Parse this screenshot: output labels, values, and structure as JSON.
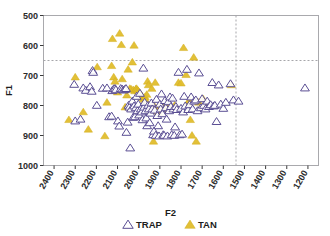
{
  "chart_data": {
    "type": "scatter",
    "title": "",
    "xlabel": "F2",
    "ylabel": "F1",
    "xlim": [
      2450,
      1150
    ],
    "ylim": [
      1000,
      500
    ],
    "x_inverted": true,
    "y_inverted": true,
    "grid": false,
    "legend_position": "bottom",
    "xticks": [
      2400,
      2300,
      2200,
      2100,
      2000,
      1900,
      1800,
      1700,
      1600,
      1500,
      1400,
      1300,
      1200
    ],
    "yticks": [
      500,
      600,
      700,
      800,
      900,
      1000
    ],
    "reference_lines": [
      {
        "orientation": "horizontal",
        "value": 650,
        "style": "dashed"
      },
      {
        "orientation": "vertical",
        "value": 1540,
        "style": "dashed"
      }
    ],
    "series": [
      {
        "name": "TRAP",
        "marker": "open-triangle",
        "color": "#ffffff",
        "edge_color": "#5b4f94",
        "points": [
          [
            2305,
            730
          ],
          [
            2300,
            852
          ],
          [
            2275,
            846
          ],
          [
            2262,
            742
          ],
          [
            2250,
            750
          ],
          [
            2230,
            738
          ],
          [
            2222,
            753
          ],
          [
            2218,
            684
          ],
          [
            2215,
            690
          ],
          [
            2198,
            800
          ],
          [
            2170,
            743
          ],
          [
            2150,
            742
          ],
          [
            2140,
            838
          ],
          [
            2128,
            836
          ],
          [
            2125,
            751
          ],
          [
            2118,
            745
          ],
          [
            2112,
            744
          ],
          [
            2108,
            748
          ],
          [
            2098,
            852
          ],
          [
            2092,
            869
          ],
          [
            2085,
            744
          ],
          [
            2078,
            746
          ],
          [
            2072,
            749
          ],
          [
            2066,
            747
          ],
          [
            2060,
            744
          ],
          [
            2058,
            890
          ],
          [
            2052,
            856
          ],
          [
            2048,
            800
          ],
          [
            2044,
            806
          ],
          [
            2040,
            942
          ],
          [
            2036,
            812
          ],
          [
            2030,
            786
          ],
          [
            2026,
            840
          ],
          [
            2022,
            802
          ],
          [
            2018,
            838
          ],
          [
            2014,
            808
          ],
          [
            2010,
            770
          ],
          [
            2006,
            818
          ],
          [
            2002,
            796
          ],
          [
            1998,
            832
          ],
          [
            1994,
            760
          ],
          [
            1990,
            812
          ],
          [
            1986,
            822
          ],
          [
            1982,
            848
          ],
          [
            1978,
            676
          ],
          [
            1975,
            806
          ],
          [
            1972,
            790
          ],
          [
            1968,
            818
          ],
          [
            1964,
            842
          ],
          [
            1960,
            868
          ],
          [
            1956,
            800
          ],
          [
            1952,
            812
          ],
          [
            1948,
            858
          ],
          [
            1944,
            826
          ],
          [
            1940,
            792
          ],
          [
            1936,
            812
          ],
          [
            1932,
            898
          ],
          [
            1928,
            886
          ],
          [
            1924,
            816
          ],
          [
            1920,
            900
          ],
          [
            1916,
            780
          ],
          [
            1912,
            834
          ],
          [
            1908,
            868
          ],
          [
            1904,
            902
          ],
          [
            1900,
            796
          ],
          [
            1896,
            812
          ],
          [
            1892,
            762
          ],
          [
            1888,
            828
          ],
          [
            1884,
            898
          ],
          [
            1880,
            900
          ],
          [
            1876,
            784
          ],
          [
            1872,
            808
          ],
          [
            1868,
            846
          ],
          [
            1864,
            902
          ],
          [
            1860,
            788
          ],
          [
            1856,
            818
          ],
          [
            1852,
            772
          ],
          [
            1848,
            804
          ],
          [
            1844,
            898
          ],
          [
            1840,
            776
          ],
          [
            1836,
            812
          ],
          [
            1832,
            900
          ],
          [
            1828,
            872
          ],
          [
            1824,
            804
          ],
          [
            1820,
            814
          ],
          [
            1812,
            690
          ],
          [
            1806,
            898
          ],
          [
            1800,
            810
          ],
          [
            1795,
            896
          ],
          [
            1790,
            822
          ],
          [
            1785,
            770
          ],
          [
            1780,
            802
          ],
          [
            1772,
            680
          ],
          [
            1766,
            814
          ],
          [
            1760,
            798
          ],
          [
            1752,
            772
          ],
          [
            1745,
            812
          ],
          [
            1738,
            786
          ],
          [
            1730,
            782
          ],
          [
            1722,
            818
          ],
          [
            1715,
            692
          ],
          [
            1706,
            808
          ],
          [
            1700,
            778
          ],
          [
            1692,
            800
          ],
          [
            1684,
            812
          ],
          [
            1676,
            786
          ],
          [
            1668,
            804
          ],
          [
            1660,
            798
          ],
          [
            1652,
            724
          ],
          [
            1646,
            802
          ],
          [
            1640,
            800
          ],
          [
            1632,
            854
          ],
          [
            1622,
            732
          ],
          [
            1612,
            796
          ],
          [
            1600,
            810
          ],
          [
            1588,
            790
          ],
          [
            1566,
            728
          ],
          [
            1552,
            782
          ],
          [
            1528,
            786
          ],
          [
            1214,
            742
          ]
        ]
      },
      {
        "name": "TAN",
        "marker": "filled-triangle",
        "color": "#e0bd2c",
        "points": [
          [
            2330,
            848
          ],
          [
            2300,
            706
          ],
          [
            2262,
            822
          ],
          [
            2238,
            880
          ],
          [
            2196,
            672
          ],
          [
            2160,
            902
          ],
          [
            2150,
            790
          ],
          [
            2128,
            668
          ],
          [
            2124,
            578
          ],
          [
            2118,
            706
          ],
          [
            2112,
            720
          ],
          [
            2108,
            750
          ],
          [
            2100,
            756
          ],
          [
            2090,
            560
          ],
          [
            2082,
            598
          ],
          [
            2078,
            712
          ],
          [
            2064,
            806
          ],
          [
            2056,
            766
          ],
          [
            2050,
            680
          ],
          [
            2042,
            744
          ],
          [
            2036,
            746
          ],
          [
            2030,
            656
          ],
          [
            2026,
            748
          ],
          [
            2022,
            600
          ],
          [
            2018,
            752
          ],
          [
            2014,
            746
          ],
          [
            2010,
            744
          ],
          [
            2006,
            748
          ],
          [
            2002,
            752
          ],
          [
            1998,
            756
          ],
          [
            1994,
            760
          ],
          [
            1990,
            764
          ],
          [
            1986,
            768
          ],
          [
            1982,
            772
          ],
          [
            1978,
            776
          ],
          [
            1974,
            780
          ],
          [
            1970,
            772
          ],
          [
            1966,
            784
          ],
          [
            1962,
            764
          ],
          [
            1958,
            720
          ],
          [
            1954,
            732
          ],
          [
            1950,
            806
          ],
          [
            1946,
            812
          ],
          [
            1942,
            818
          ],
          [
            1938,
            744
          ],
          [
            1934,
            804
          ],
          [
            1930,
            920
          ],
          [
            1926,
            802
          ],
          [
            1922,
            724
          ],
          [
            1918,
            898
          ],
          [
            1912,
            808
          ],
          [
            1906,
            824
          ],
          [
            1900,
            806
          ],
          [
            1894,
            810
          ],
          [
            1888,
            814
          ],
          [
            1882,
            806
          ],
          [
            1876,
            808
          ],
          [
            1868,
            802
          ],
          [
            1856,
            806
          ],
          [
            1844,
            810
          ],
          [
            1830,
            800
          ],
          [
            1812,
            724
          ],
          [
            1800,
            726
          ],
          [
            1788,
            608
          ],
          [
            1776,
            698
          ],
          [
            1768,
            792
          ],
          [
            1760,
            782
          ],
          [
            1756,
            848
          ],
          [
            1748,
            900
          ],
          [
            1740,
            640
          ],
          [
            1728,
            920
          ],
          [
            1716,
            790
          ],
          [
            1706,
            806
          ],
          [
            1696,
            778
          ],
          [
            1686,
            800
          ],
          [
            1562,
            732
          ]
        ]
      }
    ]
  },
  "axes": {
    "x_title": "F2",
    "y_title": "F1",
    "x_tick_labels": [
      "2400",
      "2300",
      "2200",
      "2100",
      "2000",
      "1900",
      "1800",
      "1700",
      "1600",
      "1500",
      "1400",
      "1300",
      "1200"
    ],
    "y_tick_labels": [
      "500",
      "600",
      "700",
      "800",
      "900",
      "1000"
    ]
  },
  "legend": {
    "items": [
      {
        "label": "TRAP",
        "marker": "open-triangle"
      },
      {
        "label": "TAN",
        "marker": "filled-triangle"
      }
    ]
  },
  "colors": {
    "tan_fill": "#e0bd2c",
    "trap_stroke": "#5b4f94",
    "axis": "#a9a9ad",
    "text": "#1d1d1d"
  }
}
